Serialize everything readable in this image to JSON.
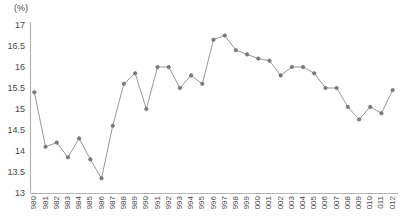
{
  "chart_data": {
    "type": "line",
    "title": "",
    "subtitle": "",
    "unit_label": "(%)",
    "xlabel": "",
    "ylabel": "",
    "ylim": [
      13,
      17
    ],
    "yticks": [
      13,
      13.5,
      14,
      14.5,
      15,
      15.5,
      16,
      16.5,
      17
    ],
    "ytick_labels": [
      "13",
      "13.5",
      "14",
      "14.5",
      "15",
      "15.5",
      "16",
      "16.5",
      "17"
    ],
    "grid": false,
    "legend": "none",
    "marker": "circle",
    "line_color": "#8c8c8c",
    "marker_color": "#7a7a7a",
    "axis_color": "#b5b5b5",
    "categories": [
      "1980",
      "1981",
      "1982",
      "1983",
      "1984",
      "1985",
      "1986",
      "1987",
      "1988",
      "1989",
      "1990",
      "1991",
      "1992",
      "1993",
      "1994",
      "1995",
      "1996",
      "1997",
      "1998",
      "1999",
      "2000",
      "2001",
      "2002",
      "2003",
      "2004",
      "2005",
      "2006",
      "2007",
      "2008",
      "2009",
      "2010",
      "2011",
      "2012"
    ],
    "tick_labels_visible": [
      "980",
      "981",
      "982",
      "983",
      "984",
      "985",
      "986",
      "987",
      "988",
      "989",
      "990",
      "991",
      "992",
      "993",
      "994",
      "995",
      "996",
      "997",
      "998",
      "999",
      "000",
      "001",
      "002",
      "003",
      "004",
      "005",
      "006",
      "007",
      "008",
      "009",
      "010",
      "011",
      "012"
    ],
    "values": [
      15.4,
      14.1,
      14.2,
      13.85,
      14.3,
      13.8,
      13.35,
      14.6,
      15.6,
      15.85,
      15.0,
      16.0,
      16.0,
      15.5,
      15.8,
      15.6,
      16.65,
      16.75,
      16.4,
      16.3,
      16.2,
      16.15,
      15.8,
      16.0,
      16.0,
      15.85,
      15.5,
      15.5,
      15.05,
      14.75,
      15.05,
      14.9,
      15.45
    ]
  }
}
